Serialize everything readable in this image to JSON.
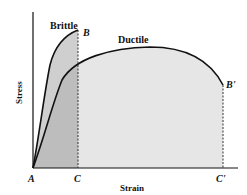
{
  "figure": {
    "type": "stress-strain diagram",
    "x_axis_label": "Strain",
    "y_axis_label": "Stress",
    "curves": [
      {
        "name": "Brittle",
        "label": "Brittle",
        "end_point": "B",
        "end_x_point": "C"
      },
      {
        "name": "Ductile",
        "label": "Ductile",
        "end_point": "B'",
        "end_x_point": "C'"
      }
    ],
    "points": {
      "origin": "A",
      "brittle_fracture": "B",
      "brittle_strain": "C",
      "ductile_fracture": "B'",
      "ductile_strain": "C'"
    },
    "colors": {
      "line": "#111111",
      "brittle_fill": "#c9c9c9",
      "ductile_fill": "#e3e3e3",
      "background": "#ffffff"
    }
  }
}
